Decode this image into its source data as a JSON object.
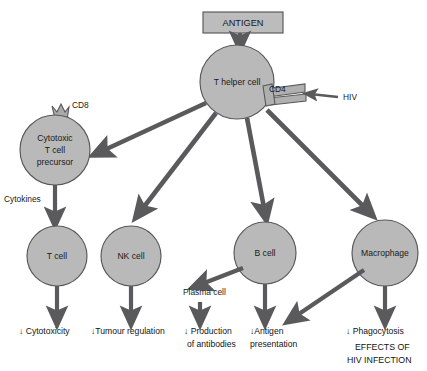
{
  "diagram": {
    "colors": {
      "cell_fill": "#b9b9b9",
      "cell_stroke": "#58585a",
      "arrow": "#5a5a5c",
      "box_fill": "#bcbcbc",
      "text": "#141414",
      "background": "#ffffff"
    },
    "source_box": {
      "label": "ANTIGEN"
    },
    "nodes": [
      {
        "id": "t-helper-cell",
        "label": "T helper cell",
        "cx": 237,
        "cy": 82,
        "r": 37
      },
      {
        "id": "cytotoxic-t-cell-precursor",
        "label_lines": [
          "Cytotoxic",
          "T cell",
          "precursor"
        ],
        "cx": 55,
        "cy": 150,
        "r": 35
      },
      {
        "id": "t-cell",
        "label": "T cell",
        "cx": 57,
        "cy": 256,
        "r": 30
      },
      {
        "id": "nk-cell",
        "label": "NK cell",
        "cx": 131,
        "cy": 256,
        "r": 30
      },
      {
        "id": "b-cell",
        "label": "B cell",
        "cx": 265,
        "cy": 253,
        "r": 31
      },
      {
        "id": "macrophage",
        "label": "Macrophage",
        "cx": 385,
        "cy": 253,
        "r": 33
      }
    ],
    "receptors": [
      {
        "id": "cd4-receptor",
        "label": "CD4",
        "attached_to": "t-helper-cell"
      },
      {
        "id": "cd8-receptor",
        "label": "CD8",
        "attached_to": "cytotoxic-t-cell-precursor"
      }
    ],
    "virus": {
      "label": "HIV",
      "target": "cd4-receptor"
    },
    "mediators": [
      {
        "id": "cytokines-label",
        "label": "Cytokines"
      }
    ],
    "intermediates": [
      {
        "id": "plasma-cell",
        "label": "Plasma cell"
      }
    ],
    "outcomes": [
      {
        "id": "outcome-cytotoxicity",
        "lines": [
          "↓ Cytotoxicity"
        ],
        "from": "t-cell"
      },
      {
        "id": "outcome-tumour-regulation",
        "lines": [
          "↓Tumour regulation"
        ],
        "from": "nk-cell"
      },
      {
        "id": "outcome-antibody-production",
        "lines": [
          "↓ Production",
          "of antibodies"
        ],
        "from": "plasma-cell"
      },
      {
        "id": "outcome-antigen-presentation",
        "lines": [
          "↓Antigen",
          "presentation"
        ],
        "from": "b-cell"
      },
      {
        "id": "outcome-phagocytosis",
        "lines": [
          "↓ Phagocytosis"
        ],
        "from": "macrophage"
      }
    ],
    "footer": {
      "lines": [
        "EFFECTS OF",
        "HIV INFECTION"
      ]
    }
  }
}
